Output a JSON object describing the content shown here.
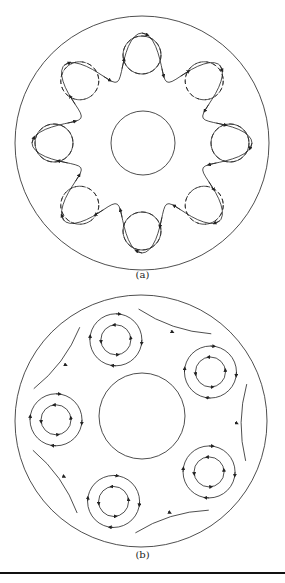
{
  "figure": {
    "panel_a": {
      "label": "(a)",
      "description": "Annulus with 8 counter-rotating vortex pairs; wavy streamlines with arrows around vortices, dashed lines for secondary cells",
      "vortex_count": 8
    },
    "panel_b": {
      "label": "(b)",
      "description": "Annulus with 5 vortices, each shown as two concentric circular streamlines with arrows, plus wavy streamlines between them",
      "vortex_count": 5
    }
  },
  "colors": {
    "line": "#222222",
    "background": "#ffffff"
  }
}
